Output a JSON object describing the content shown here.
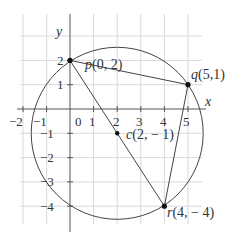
{
  "diagram": {
    "type": "coordinate-geometry",
    "axes": {
      "x_label": "x",
      "y_label": "y",
      "x_ticks": [
        "−2",
        "−1",
        "0",
        "1",
        "2",
        "3",
        "4",
        "5"
      ],
      "y_ticks": [
        "2",
        "1",
        "−1",
        "−2",
        "−3",
        "−4"
      ]
    },
    "points": [
      {
        "name": "p",
        "label": "p(0, 2)",
        "x": 0,
        "y": 2
      },
      {
        "name": "q",
        "label": "q(5,1)",
        "x": 5,
        "y": 1
      },
      {
        "name": "r",
        "label": "r(4, − 4)",
        "x": 4,
        "y": -4
      },
      {
        "name": "c",
        "label": "c(2, − 1)",
        "x": 2,
        "y": -1
      }
    ],
    "circle": {
      "center": "c(2,-1)",
      "radius": "sqrt(13)"
    },
    "triangle": [
      "p",
      "q",
      "r"
    ],
    "segments": [
      "p-q",
      "q-r",
      "r-p"
    ],
    "colors": {
      "grid": "#d9d9d9",
      "stroke": "#444444",
      "point": "#111111"
    }
  }
}
